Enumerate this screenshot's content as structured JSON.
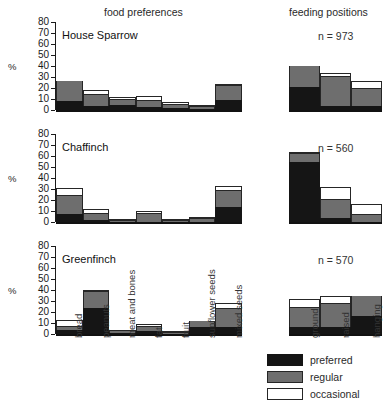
{
  "headers": {
    "food": "food preferences",
    "positions": "feeding positions"
  },
  "axis": {
    "ylabel": "%",
    "yticks": [
      0,
      10,
      20,
      30,
      40,
      50,
      60,
      70,
      80
    ],
    "ylim": [
      0,
      80
    ]
  },
  "legend": {
    "items": [
      {
        "key": "preferred",
        "label": "preferred",
        "color": "#151515"
      },
      {
        "key": "regular",
        "label": "regular",
        "color": "#6e6e6e"
      },
      {
        "key": "occasional",
        "label": "occasional",
        "color": "#ffffff"
      }
    ]
  },
  "food_categories": [
    "bread",
    "peanuts",
    "meat and bones",
    "fat",
    "fruit",
    "sunflower seeds",
    "mixed seeds"
  ],
  "position_categories": [
    "ground",
    "raised",
    "hanging"
  ],
  "species": [
    {
      "name": "House Sparrow",
      "n_label": "n = 973",
      "food": {
        "preferred": [
          8,
          4,
          5,
          3,
          2,
          1,
          9
        ],
        "regular": [
          18,
          10,
          4,
          5,
          3,
          2,
          13
        ],
        "occasional": [
          0,
          4,
          3,
          5,
          2,
          2,
          1
        ]
      },
      "positions": {
        "preferred": [
          21,
          4,
          4
        ],
        "regular": [
          19,
          26,
          15
        ],
        "occasional": [
          0,
          4,
          7
        ]
      }
    },
    {
      "name": "Chaffinch",
      "n_label": "n = 560",
      "food": {
        "preferred": [
          7,
          2,
          0,
          0,
          0,
          0,
          14
        ],
        "regular": [
          17,
          5,
          1,
          7,
          1,
          3,
          14
        ],
        "occasional": [
          7,
          5,
          2,
          3,
          2,
          2,
          5
        ]
      },
      "positions": {
        "preferred": [
          55,
          4,
          0
        ],
        "regular": [
          7,
          16,
          6
        ],
        "occasional": [
          2,
          12,
          10
        ]
      }
    },
    {
      "name": "Greenfinch",
      "n_label": "n = 570",
      "food": {
        "preferred": [
          4,
          24,
          1,
          3,
          0,
          6,
          6
        ],
        "regular": [
          2,
          14,
          1,
          3,
          1,
          6,
          17
        ],
        "occasional": [
          7,
          1,
          1,
          3,
          1,
          0,
          5
        ]
      },
      "positions": {
        "preferred": [
          6,
          6,
          16
        ],
        "regular": [
          18,
          21,
          19
        ],
        "occasional": [
          8,
          8,
          0
        ]
      }
    }
  ]
}
